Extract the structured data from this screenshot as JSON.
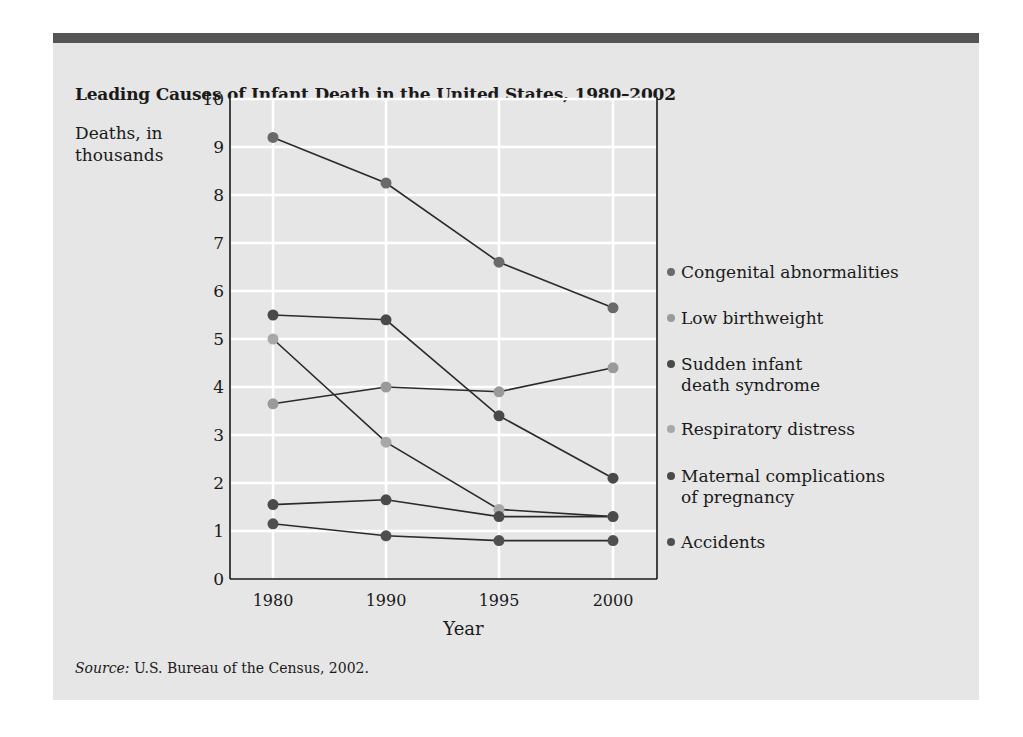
{
  "title": "Leading Causes of Infant Death in the United States, 1980–2002",
  "ylabel_line1": "Deaths, in",
  "ylabel_line2": "thousands",
  "xlabel": "Year",
  "source_label": "Source:",
  "source_text": " U.S. Bureau of the Census, 2002.",
  "colors": {
    "panel_bg": "#e6e6e6",
    "top_bar": "#555555",
    "grid": "#ffffff",
    "line": "#2b2b2b"
  },
  "legend": [
    {
      "label": "Congenital abnormalities",
      "color": "#6a6a6a"
    },
    {
      "label": "Low birthweight",
      "color": "#9a9a9a"
    },
    {
      "label": "Sudden infant death syndrome",
      "line1": "Sudden infant",
      "line2": "death syndrome",
      "color": "#4a4a4a"
    },
    {
      "label": "Respiratory distress",
      "color": "#a8a8a8"
    },
    {
      "label": "Maternal complications of pregnancy",
      "line1": "Maternal complications",
      "line2": "of pregnancy",
      "color": "#4a4a4a"
    },
    {
      "label": "Accidents",
      "color": "#4f4f4f"
    }
  ],
  "chart_data": {
    "type": "line",
    "title": "Leading Causes of Infant Death in the United States, 1980–2002",
    "xlabel": "Year",
    "ylabel": "Deaths, in thousands",
    "categories": [
      "1980",
      "1990",
      "1995",
      "2000"
    ],
    "yticks": [
      0,
      1,
      2,
      3,
      4,
      5,
      6,
      7,
      8,
      9,
      10
    ],
    "ylim": [
      0,
      10
    ],
    "grid": true,
    "legend_position": "right",
    "series": [
      {
        "name": "Congenital abnormalities",
        "values": [
          9.2,
          8.25,
          6.6,
          5.65
        ]
      },
      {
        "name": "Low birthweight",
        "values": [
          3.65,
          4.0,
          3.9,
          4.4
        ]
      },
      {
        "name": "Sudden infant death syndrome",
        "values": [
          5.5,
          5.4,
          3.4,
          2.1
        ]
      },
      {
        "name": "Respiratory distress",
        "values": [
          5.0,
          2.85,
          1.45,
          1.3
        ]
      },
      {
        "name": "Maternal complications of pregnancy",
        "values": [
          1.55,
          1.65,
          1.3,
          1.3
        ]
      },
      {
        "name": "Accidents",
        "values": [
          1.15,
          0.9,
          0.8,
          0.8
        ]
      }
    ],
    "source": "Source: U.S. Bureau of the Census, 2002."
  }
}
